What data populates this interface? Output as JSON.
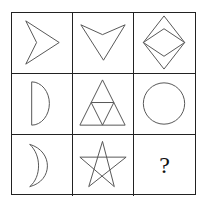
{
  "puzzle": {
    "rows": 3,
    "cols": 3,
    "line_color": "#555555",
    "grid_color": "#222222",
    "cells": [
      {
        "row": 1,
        "col": 1,
        "shape": "arrowhead-right"
      },
      {
        "row": 1,
        "col": 2,
        "shape": "arrowhead-down"
      },
      {
        "row": 1,
        "col": 3,
        "shape": "nested-diamonds"
      },
      {
        "row": 2,
        "col": 1,
        "shape": "half-circle"
      },
      {
        "row": 2,
        "col": 2,
        "shape": "subdivided-triangle"
      },
      {
        "row": 2,
        "col": 3,
        "shape": "circle"
      },
      {
        "row": 3,
        "col": 1,
        "shape": "crescent"
      },
      {
        "row": 3,
        "col": 2,
        "shape": "pentagram"
      },
      {
        "row": 3,
        "col": 3,
        "shape": "unknown",
        "label": "?"
      }
    ]
  }
}
